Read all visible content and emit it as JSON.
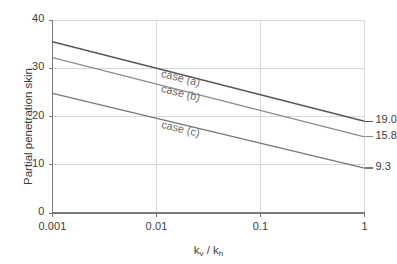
{
  "chart_data": {
    "type": "line",
    "title": "",
    "xlabel": "kv / kh",
    "xlabel_parts": {
      "num": "k",
      "num_sub": "v",
      "sep": " / ",
      "den": "k",
      "den_sub": "h"
    },
    "ylabel": "Partial penetration skin",
    "xscale": "log",
    "xlim": [
      0.001,
      1
    ],
    "ylim": [
      0,
      40
    ],
    "xticks": [
      "0.001",
      "0.01",
      "0.1",
      "1"
    ],
    "xtick_values": [
      0.001,
      0.01,
      0.1,
      1
    ],
    "yticks": [
      "0",
      "10",
      "20",
      "30",
      "40"
    ],
    "ytick_values": [
      0,
      10,
      20,
      30,
      40
    ],
    "grid": true,
    "grid_color": "#d9d9d9",
    "axis_color": "#808080",
    "legend_position": "inline-on-curves",
    "series": [
      {
        "name": "case (a)",
        "label": "case (a)",
        "color": "#595959",
        "width": 1.6,
        "x": [
          0.001,
          1
        ],
        "y": [
          35.5,
          19.0
        ],
        "end_label": "19.0",
        "label_x": 0.0115,
        "label_y": 30.3
      },
      {
        "name": "case (b)",
        "label": "case (b)",
        "color": "#8c8c8c",
        "width": 1.3,
        "x": [
          0.001,
          1
        ],
        "y": [
          32.2,
          15.8
        ],
        "end_label": "15.8",
        "label_x": 0.0115,
        "label_y": 27.2
      },
      {
        "name": "case (c)",
        "label": "case (c)",
        "color": "#777777",
        "width": 1.3,
        "x": [
          0.001,
          1
        ],
        "y": [
          24.8,
          9.3
        ],
        "end_label": "9.3",
        "label_x": 0.0115,
        "label_y": 19.7
      }
    ],
    "end_labels": [
      "19.0",
      "15.8",
      "9.3"
    ]
  }
}
